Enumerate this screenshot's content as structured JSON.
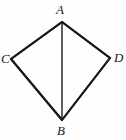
{
  "figure": {
    "kind": "geometry-diagram",
    "shape_name": "kite",
    "background_color": "#fefefe",
    "stroke_color": "#1a1a1a",
    "outline_stroke_width": 2,
    "diagonal_stroke_width": 1.4,
    "viewbox": {
      "width": 126,
      "height": 140
    },
    "vertices": [
      {
        "id": "A",
        "label": "A",
        "x": 62,
        "y": 22,
        "label_x": 56,
        "label_y": 3
      },
      {
        "id": "C",
        "label": "C",
        "x": 11,
        "y": 59,
        "label_x": 1,
        "label_y": 52
      },
      {
        "id": "D",
        "label": "D",
        "x": 110,
        "y": 58,
        "label_x": 114,
        "label_y": 51
      },
      {
        "id": "B",
        "label": "B",
        "x": 62,
        "y": 120,
        "label_x": 57,
        "label_y": 124
      }
    ],
    "outline_path": "M 62 22 L 11 59 L 62 120 L 110 58 Z",
    "segments": [
      {
        "id": "AC",
        "from": "A",
        "to": "C",
        "x1": 62,
        "y1": 22,
        "x2": 11,
        "y2": 59,
        "kind": "side"
      },
      {
        "id": "CB",
        "from": "C",
        "to": "B",
        "x1": 11,
        "y1": 59,
        "x2": 62,
        "y2": 120,
        "kind": "side"
      },
      {
        "id": "BD",
        "from": "B",
        "to": "D",
        "x1": 62,
        "y1": 120,
        "x2": 110,
        "y2": 58,
        "kind": "side"
      },
      {
        "id": "DA",
        "from": "D",
        "to": "A",
        "x1": 110,
        "y1": 58,
        "x2": 62,
        "y2": 22,
        "kind": "side"
      },
      {
        "id": "AB",
        "from": "A",
        "to": "B",
        "x1": 62,
        "y1": 22,
        "x2": 62,
        "y2": 120,
        "kind": "diagonal"
      }
    ]
  }
}
